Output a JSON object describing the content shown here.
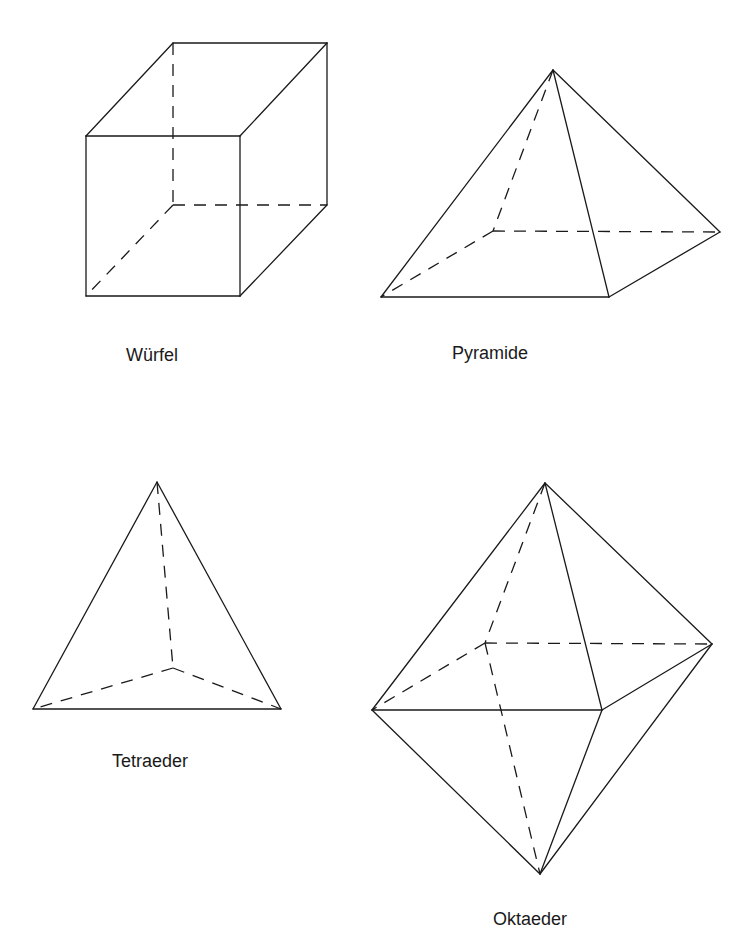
{
  "figures": [
    {
      "name": "Würfel",
      "label": "Würfel",
      "label_pos": [
        126,
        361
      ],
      "solid_edges": [
        [
          [
            86,
            136
          ],
          [
            240,
            136
          ]
        ],
        [
          [
            240,
            136
          ],
          [
            240,
            296
          ]
        ],
        [
          [
            240,
            296
          ],
          [
            86,
            296
          ]
        ],
        [
          [
            86,
            296
          ],
          [
            86,
            136
          ]
        ],
        [
          [
            86,
            136
          ],
          [
            173,
            43
          ]
        ],
        [
          [
            240,
            136
          ],
          [
            327,
            43
          ]
        ],
        [
          [
            173,
            43
          ],
          [
            327,
            43
          ]
        ],
        [
          [
            327,
            43
          ],
          [
            327,
            205
          ]
        ],
        [
          [
            240,
            296
          ],
          [
            327,
            205
          ]
        ]
      ],
      "dashed_edges": [
        [
          [
            173,
            43
          ],
          [
            173,
            205
          ]
        ],
        [
          [
            173,
            205
          ],
          [
            327,
            205
          ]
        ],
        [
          [
            173,
            205
          ],
          [
            86,
            296
          ]
        ]
      ]
    },
    {
      "name": "Pyramide",
      "label": "Pyramide",
      "label_pos": [
        452,
        359
      ],
      "solid_edges": [
        [
          [
            553,
            70
          ],
          [
            381,
            297
          ]
        ],
        [
          [
            553,
            70
          ],
          [
            609,
            297
          ]
        ],
        [
          [
            553,
            70
          ],
          [
            720,
            232
          ]
        ],
        [
          [
            381,
            297
          ],
          [
            609,
            297
          ]
        ],
        [
          [
            609,
            297
          ],
          [
            720,
            232
          ]
        ]
      ],
      "dashed_edges": [
        [
          [
            553,
            70
          ],
          [
            493,
            231
          ]
        ],
        [
          [
            493,
            231
          ],
          [
            381,
            297
          ]
        ],
        [
          [
            493,
            231
          ],
          [
            720,
            232
          ]
        ]
      ]
    },
    {
      "name": "Tetraeder",
      "label": "Tetraeder",
      "label_pos": [
        112,
        767
      ],
      "solid_edges": [
        [
          [
            157,
            482
          ],
          [
            33,
            709
          ]
        ],
        [
          [
            157,
            482
          ],
          [
            281,
            709
          ]
        ],
        [
          [
            33,
            709
          ],
          [
            281,
            709
          ]
        ]
      ],
      "dashed_edges": [
        [
          [
            157,
            482
          ],
          [
            173,
            668
          ]
        ],
        [
          [
            173,
            668
          ],
          [
            33,
            709
          ]
        ],
        [
          [
            173,
            668
          ],
          [
            281,
            709
          ]
        ]
      ]
    },
    {
      "name": "Oktaeder",
      "label": "Oktaeder",
      "label_pos": [
        493,
        925
      ],
      "solid_edges": [
        [
          [
            545,
            483
          ],
          [
            372,
            710
          ]
        ],
        [
          [
            545,
            483
          ],
          [
            602,
            710
          ]
        ],
        [
          [
            545,
            483
          ],
          [
            712,
            644
          ]
        ],
        [
          [
            372,
            710
          ],
          [
            602,
            710
          ]
        ],
        [
          [
            602,
            710
          ],
          [
            712,
            644
          ]
        ],
        [
          [
            372,
            710
          ],
          [
            540,
            874
          ]
        ],
        [
          [
            602,
            710
          ],
          [
            540,
            874
          ]
        ],
        [
          [
            712,
            644
          ],
          [
            540,
            874
          ]
        ]
      ],
      "dashed_edges": [
        [
          [
            545,
            483
          ],
          [
            485,
            643
          ]
        ],
        [
          [
            485,
            643
          ],
          [
            372,
            710
          ]
        ],
        [
          [
            485,
            643
          ],
          [
            712,
            644
          ]
        ],
        [
          [
            485,
            643
          ],
          [
            540,
            874
          ]
        ]
      ]
    }
  ],
  "labels": {
    "cube": "Würfel",
    "pyramid": "Pyramide",
    "tetrahedron": "Tetraeder",
    "octahedron": "Oktaeder"
  },
  "colors": {
    "line": "#1a1a1a",
    "background": "#ffffff"
  }
}
